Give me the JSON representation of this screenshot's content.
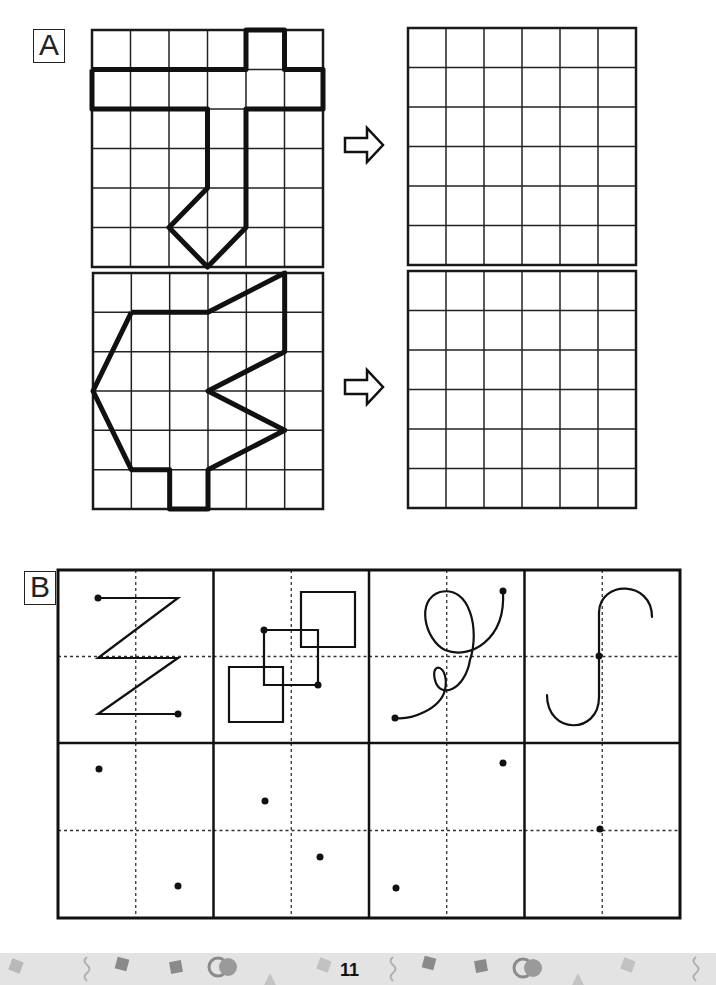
{
  "section_a": {
    "label": "A",
    "arrow_icon": "right-arrow-outline",
    "exercises": [
      {
        "source_grid": {
          "x": 92,
          "y": 30,
          "w": 231,
          "h": 237,
          "cols": 6,
          "rows": 6
        },
        "target_grid": {
          "x": 408,
          "y": 28,
          "w": 228,
          "h": 237,
          "cols": 6,
          "rows": 6
        },
        "arrow": {
          "x": 345,
          "y": 138
        },
        "shape_points": [
          [
            0,
            1
          ],
          [
            4,
            1
          ],
          [
            4,
            0
          ],
          [
            5,
            0
          ],
          [
            5,
            1
          ],
          [
            6,
            1
          ],
          [
            6,
            2
          ],
          [
            4,
            2
          ],
          [
            4,
            5
          ],
          [
            3,
            6
          ],
          [
            2,
            5
          ],
          [
            3,
            4
          ],
          [
            3,
            2
          ],
          [
            0,
            2
          ],
          [
            0,
            1
          ]
        ]
      },
      {
        "source_grid": {
          "x": 93,
          "y": 273,
          "w": 230,
          "h": 236,
          "cols": 6,
          "rows": 6
        },
        "target_grid": {
          "x": 408,
          "y": 271,
          "w": 228,
          "h": 237,
          "cols": 6,
          "rows": 6
        },
        "arrow": {
          "x": 345,
          "y": 380
        },
        "shape_points": [
          [
            1,
            1
          ],
          [
            3,
            1
          ],
          [
            5,
            0
          ],
          [
            5,
            2
          ],
          [
            3,
            3
          ],
          [
            5,
            4
          ],
          [
            3,
            5
          ],
          [
            3,
            6
          ],
          [
            2,
            6
          ],
          [
            2,
            5
          ],
          [
            1,
            5
          ],
          [
            0,
            3
          ],
          [
            1,
            1
          ]
        ]
      }
    ]
  },
  "section_b": {
    "label": "B",
    "table": {
      "x": 58,
      "y": 570,
      "w": 622,
      "h": 348,
      "cols": 4,
      "row_split": 743
    },
    "models": [
      {
        "name": "zigzag-path",
        "paths": [
          "M98,598 L178,598 L98,658 L178,658 L98,714 L178,714"
        ],
        "dots": [
          [
            98,
            598
          ],
          [
            178,
            714
          ]
        ]
      },
      {
        "name": "overlapping-squares",
        "paths": [
          "M301,592 h54 v55 h-54 z",
          "M229,667 h54 v55 h-54 z",
          "M264,630 h54 v55 h-54 z"
        ],
        "dots": [
          [
            264,
            630
          ],
          [
            318,
            685
          ]
        ]
      },
      {
        "name": "loop-curve",
        "paths": [
          "M503,591 C506,640 470,660 445,650 C425,640 415,600 440,592 C470,585 480,630 470,660 C465,690 440,700 435,680 C430,660 450,665 445,690 C440,710 410,720 395,718"
        ],
        "dots": [
          [
            503,
            591
          ],
          [
            395,
            718
          ]
        ]
      },
      {
        "name": "s-hook-curve",
        "paths": [
          "M652,617 C652,580 600,580 599,612 L599,697 C599,735 547,735 547,695"
        ],
        "dots": [
          [
            599,
            656
          ]
        ]
      }
    ],
    "practice_dots": [
      [
        [
          99,
          769
        ],
        [
          178,
          886
        ]
      ],
      [
        [
          265,
          801
        ],
        [
          320,
          857
        ]
      ],
      [
        [
          503,
          763
        ],
        [
          396,
          888
        ]
      ],
      [
        [
          600,
          829
        ]
      ]
    ]
  },
  "footer": {
    "page_number": "11",
    "background": "#e3e3e3",
    "decor_color": "#9a9a9a"
  }
}
